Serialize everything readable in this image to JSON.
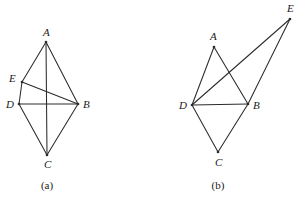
{
  "figure": {
    "background_color": "#ffffff",
    "stroke_color": "#2b2b2b",
    "text_color": "#1a1a1a",
    "panels": [
      {
        "id": "panel-a",
        "caption": "(a)",
        "caption_pos": {
          "x": 47,
          "y": 189
        },
        "vertices": [
          {
            "name": "A",
            "x": 46,
            "y": 42,
            "label": "A",
            "label_x": 43,
            "label_y": 36
          },
          {
            "name": "E",
            "x": 22,
            "y": 82,
            "label": "E",
            "label_x": 9,
            "label_y": 82
          },
          {
            "name": "D",
            "x": 19,
            "y": 104,
            "label": "D",
            "label_x": 6,
            "label_y": 108
          },
          {
            "name": "B",
            "x": 78,
            "y": 104,
            "label": "B",
            "label_x": 83,
            "label_y": 108
          },
          {
            "name": "C",
            "x": 47,
            "y": 155,
            "label": "C",
            "label_x": 44,
            "label_y": 168
          }
        ],
        "edges": [
          {
            "from": "A",
            "to": "E"
          },
          {
            "from": "E",
            "to": "D"
          },
          {
            "from": "A",
            "to": "B"
          },
          {
            "from": "A",
            "to": "C"
          },
          {
            "from": "D",
            "to": "B"
          },
          {
            "from": "D",
            "to": "C"
          },
          {
            "from": "C",
            "to": "B"
          },
          {
            "from": "E",
            "to": "B"
          }
        ]
      },
      {
        "id": "panel-b",
        "caption": "(b)",
        "caption_pos": {
          "x": 218,
          "y": 189
        },
        "vertices": [
          {
            "name": "A",
            "x": 214,
            "y": 47,
            "label": "A",
            "label_x": 210,
            "label_y": 40
          },
          {
            "name": "E",
            "x": 290,
            "y": 19,
            "label": "E",
            "label_x": 287,
            "label_y": 12
          },
          {
            "name": "D",
            "x": 192,
            "y": 105,
            "label": "D",
            "label_x": 179,
            "label_y": 109
          },
          {
            "name": "B",
            "x": 248,
            "y": 104,
            "label": "B",
            "label_x": 253,
            "label_y": 109
          },
          {
            "name": "C",
            "x": 218,
            "y": 152,
            "label": "C",
            "label_x": 215,
            "label_y": 166
          }
        ],
        "edges": [
          {
            "from": "A",
            "to": "D"
          },
          {
            "from": "A",
            "to": "B"
          },
          {
            "from": "D",
            "to": "B"
          },
          {
            "from": "D",
            "to": "C"
          },
          {
            "from": "C",
            "to": "B"
          },
          {
            "from": "D",
            "to": "E"
          },
          {
            "from": "B",
            "to": "E"
          }
        ]
      }
    ]
  }
}
